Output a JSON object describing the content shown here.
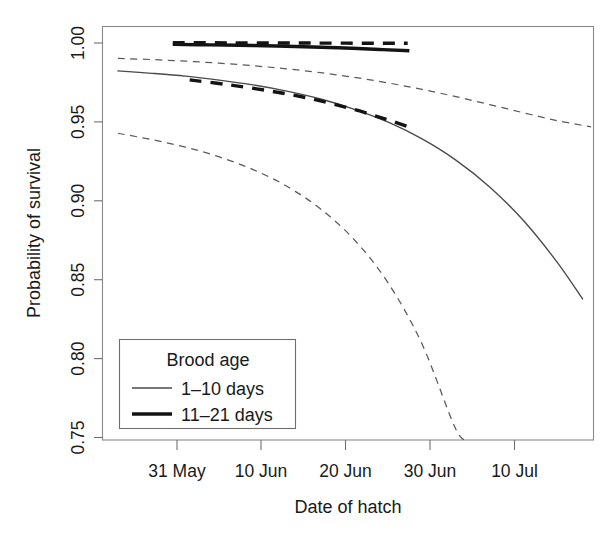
{
  "chart_data": {
    "type": "line",
    "title": "",
    "xlabel": "Date of hatch",
    "ylabel": "Probability of survival",
    "grid": false,
    "legend_position": "bottom-left",
    "legend_title": "Brood age",
    "xtick_labels": [
      "31 May",
      "10 Jun",
      "20 Jun",
      "30 Jun",
      "10 Jul"
    ],
    "xtick_days": [
      0,
      10,
      20,
      30,
      40
    ],
    "ytick_labels": [
      "0.75",
      "0.80",
      "0.85",
      "0.90",
      "0.95",
      "1.00"
    ],
    "ytick_values": [
      0.75,
      0.8,
      0.85,
      0.9,
      0.95,
      1.0
    ],
    "xlim_days": [
      -9,
      49.5
    ],
    "ylim": [
      0.745,
      1.005
    ],
    "x_axis_note": "x measured in days, day 0 = 31 May",
    "series": [
      {
        "name": "1-10 days",
        "style": "thin-solid",
        "line_width": "thin",
        "dash": "solid",
        "color": "#4a4a4a",
        "x_days": [
          -7,
          -3,
          1,
          5,
          9,
          13,
          17,
          21,
          25,
          29,
          33,
          37,
          41,
          45,
          48
        ],
        "values": [
          0.9823,
          0.9808,
          0.979,
          0.9765,
          0.9735,
          0.9695,
          0.9645,
          0.958,
          0.9498,
          0.9392,
          0.9258,
          0.9088,
          0.8875,
          0.861,
          0.8378
        ]
      },
      {
        "name": "1-10 days upper 95% CI",
        "style": "thin-dashed",
        "line_width": "thin",
        "dash": "dashed",
        "color": "#5a5a5a",
        "x_days": [
          -7,
          -3,
          1,
          5,
          9,
          13,
          17,
          21,
          25,
          29,
          33,
          37,
          41,
          45,
          49
        ],
        "values": [
          0.9903,
          0.9895,
          0.9885,
          0.9872,
          0.9856,
          0.9836,
          0.9812,
          0.9782,
          0.9747,
          0.9706,
          0.966,
          0.961,
          0.9558,
          0.9508,
          0.9468
        ]
      },
      {
        "name": "1-10 days lower 95% CI",
        "style": "thin-dashed",
        "line_width": "thin",
        "dash": "dashed",
        "color": "#5a5a5a",
        "x_days": [
          -7,
          -3,
          1,
          5,
          9,
          13,
          17,
          21,
          25,
          29,
          33,
          34.5
        ],
        "values": [
          0.9428,
          0.9388,
          0.934,
          0.9278,
          0.9198,
          0.9092,
          0.8948,
          0.8752,
          0.8478,
          0.8092,
          0.7552,
          0.7455
        ]
      },
      {
        "name": "11-21 days",
        "style": "thick-solid",
        "line_width": "thick",
        "dash": "solid",
        "color": "#141414",
        "x_days": [
          -0.5,
          4,
          9,
          14,
          19,
          24,
          27.5
        ],
        "values": [
          0.9991,
          0.9988,
          0.9984,
          0.9978,
          0.997,
          0.9959,
          0.9951
        ]
      },
      {
        "name": "11-21 days upper 95% CI",
        "style": "thick-dashed",
        "line_width": "thick",
        "dash": "dashed",
        "color": "#141414",
        "x_days": [
          -0.5,
          6,
          13,
          20,
          27.3
        ],
        "values": [
          1.0002,
          1.0001,
          1.0,
          0.9999,
          0.9998
        ]
      },
      {
        "name": "11-21 days lower 95% CI",
        "style": "thick-dashed",
        "line_width": "thick",
        "dash": "dashed",
        "color": "#141414",
        "x_days": [
          1.5,
          6,
          11,
          16,
          21,
          25,
          27.4
        ],
        "values": [
          0.9766,
          0.9736,
          0.9696,
          0.9645,
          0.9578,
          0.9512,
          0.9469
        ]
      }
    ],
    "legend_entries": [
      {
        "label": "1-10 days",
        "style": "thin-solid"
      },
      {
        "label": "11-21 days",
        "style": "thick-solid"
      }
    ]
  },
  "labels": {
    "ylabel": "Probability of survival",
    "xlabel": "Date of hatch",
    "legend_title": "Brood age",
    "legend_1": "1–10 days",
    "legend_2": "11–21 days",
    "ytick_0": "0.75",
    "ytick_1": "0.80",
    "ytick_2": "0.85",
    "ytick_3": "0.90",
    "ytick_4": "0.95",
    "ytick_5": "1.00",
    "xtick_0": "31 May",
    "xtick_1": "10 Jun",
    "xtick_2": "20 Jun",
    "xtick_3": "30 Jun",
    "xtick_4": "10 Jul"
  }
}
